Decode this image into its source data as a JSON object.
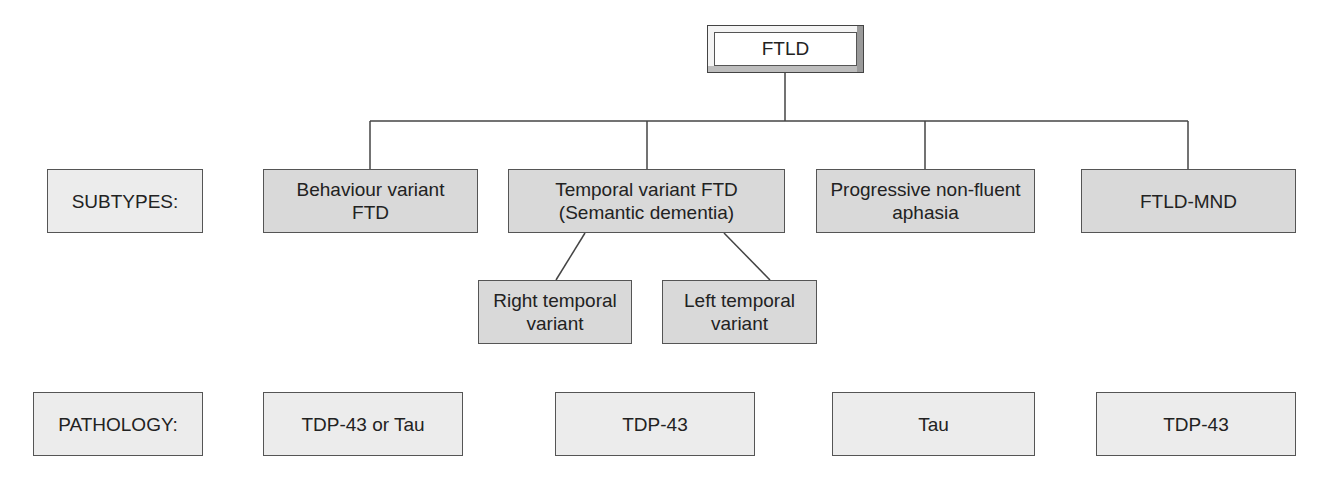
{
  "root": {
    "label": "FTLD"
  },
  "row_labels": {
    "subtypes": "SUBTYPES:",
    "pathology": "PATHOLOGY:"
  },
  "subtypes": [
    {
      "label": "Behaviour variant\nFTD"
    },
    {
      "label": "Temporal variant FTD\n(Semantic dementia)"
    },
    {
      "label": "Progressive non-fluent\naphasia"
    },
    {
      "label": "FTLD-MND"
    }
  ],
  "temporal_children": [
    {
      "label": "Right temporal\nvariant"
    },
    {
      "label": "Left temporal\nvariant"
    }
  ],
  "pathology": [
    {
      "label": "TDP-43 or Tau"
    },
    {
      "label": "TDP-43"
    },
    {
      "label": "Tau"
    },
    {
      "label": "TDP-43"
    }
  ],
  "colors": {
    "line": "#444444",
    "box_mid": "#d9d9d9",
    "box_light": "#ececec"
  }
}
